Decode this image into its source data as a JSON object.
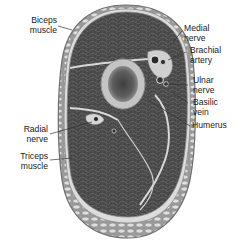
{
  "diagram": {
    "colors": {
      "muscle": "#4a4a4a",
      "muscle_dark": "#333333",
      "fascia": "#d9d9d9",
      "fat": "#cfcfcf",
      "outline": "#6e6e6e",
      "bone_cortex": "#b8b8b8",
      "bone_marrow": "#5a5a5a",
      "label_text": "#1a1a1a"
    },
    "labels": {
      "biceps": "Biceps\nmuscle",
      "medial_nerve": "Medial\nnerve",
      "brachial_artery": "Brachial\nartery",
      "ulnar_nerve": "Ulnar\nnerve",
      "basilic_vein": "Basilic\nvein",
      "humerus": "Humerus",
      "radial_nerve": "Radial\nnerve",
      "triceps": "Triceps\nmuscle"
    }
  }
}
